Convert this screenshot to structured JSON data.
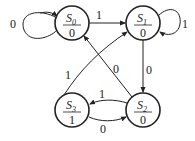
{
  "diagram": {
    "type": "state-diagram",
    "states": [
      {
        "name": "S",
        "sub": "0",
        "output": "0"
      },
      {
        "name": "S",
        "sub": "1",
        "output": "0"
      },
      {
        "name": "S",
        "sub": "2",
        "output": "0"
      },
      {
        "name": "S",
        "sub": "3",
        "output": "1"
      }
    ],
    "transitions": [
      {
        "from": "S0",
        "to": "S0",
        "input": "0"
      },
      {
        "from": "S0",
        "to": "S1",
        "input": "1"
      },
      {
        "from": "S1",
        "to": "S1",
        "input": "1"
      },
      {
        "from": "S1",
        "to": "S2",
        "input": "0"
      },
      {
        "from": "S2",
        "to": "S0",
        "input": "0"
      },
      {
        "from": "S2",
        "to": "S3",
        "input": "1"
      },
      {
        "from": "S3",
        "to": "S2",
        "input": "0"
      },
      {
        "from": "S3",
        "to": "S1",
        "input": "1"
      }
    ],
    "labels": {
      "s0_self": "0",
      "s0_s1": "1",
      "s1_self": "1",
      "s1_s2": "0",
      "s2_s0": "0",
      "s2_s3": "1",
      "s3_s2": "0",
      "s3_s1": "1"
    }
  }
}
